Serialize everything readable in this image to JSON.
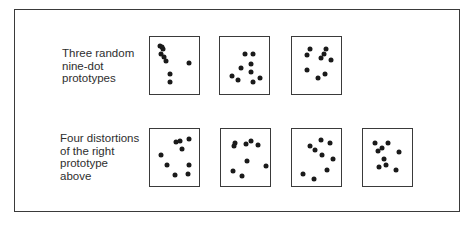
{
  "figure": {
    "top_label": [
      "Three random",
      "nine-dot",
      "prototypes"
    ],
    "bottom_label": [
      "Four distortions",
      "of the right",
      "prototype",
      "above"
    ]
  },
  "rows": [
    {
      "name": "prototypes",
      "boxes": [
        {
          "x": 149,
          "y": 36,
          "dots": [
            [
              10,
              9
            ],
            [
              13,
              12
            ],
            [
              11,
              17
            ],
            [
              14,
              20
            ],
            [
              16,
              24
            ],
            [
              20,
              37
            ],
            [
              20,
              45
            ],
            [
              39,
              26
            ],
            [
              12,
              10
            ]
          ]
        },
        {
          "x": 219,
          "y": 36,
          "dots": [
            [
              25,
              17
            ],
            [
              33,
              17
            ],
            [
              31,
              27
            ],
            [
              21,
              31
            ],
            [
              31,
              35
            ],
            [
              12,
              39
            ],
            [
              18,
              43
            ],
            [
              33,
              45
            ],
            [
              40,
              41
            ]
          ]
        },
        {
          "x": 291,
          "y": 36,
          "dots": [
            [
              18,
              12
            ],
            [
              34,
              12
            ],
            [
              15,
              18
            ],
            [
              32,
              17
            ],
            [
              29,
              21
            ],
            [
              39,
              23
            ],
            [
              15,
              33
            ],
            [
              26,
              41
            ],
            [
              33,
              37
            ]
          ]
        }
      ]
    },
    {
      "name": "distortions",
      "boxes": [
        {
          "x": 149,
          "y": 128,
          "dots": [
            [
              26,
              13
            ],
            [
              30,
              12
            ],
            [
              39,
              10
            ],
            [
              32,
              20
            ],
            [
              11,
              26
            ],
            [
              17,
              36
            ],
            [
              39,
              36
            ],
            [
              25,
              46
            ],
            [
              38,
              45
            ]
          ]
        },
        {
          "x": 220,
          "y": 128,
          "dots": [
            [
              14,
              14
            ],
            [
              13,
              17
            ],
            [
              25,
              15
            ],
            [
              30,
              12
            ],
            [
              37,
              16
            ],
            [
              26,
              32
            ],
            [
              45,
              37
            ],
            [
              12,
              42
            ],
            [
              21,
              47
            ]
          ]
        },
        {
          "x": 291,
          "y": 128,
          "dots": [
            [
              29,
              11
            ],
            [
              38,
              14
            ],
            [
              18,
              17
            ],
            [
              23,
              21
            ],
            [
              30,
              26
            ],
            [
              41,
              30
            ],
            [
              35,
              41
            ],
            [
              11,
              45
            ],
            [
              22,
              50
            ]
          ]
        },
        {
          "x": 362,
          "y": 128,
          "dots": [
            [
              12,
              14
            ],
            [
              25,
              14
            ],
            [
              15,
              22
            ],
            [
              19,
              19
            ],
            [
              21,
              30
            ],
            [
              36,
              23
            ],
            [
              16,
              38
            ],
            [
              23,
              36
            ],
            [
              33,
              41
            ]
          ]
        }
      ]
    }
  ],
  "colors": {
    "ink": "#1a1a1a",
    "frame": "#3a3a3a",
    "background": "#ffffff"
  }
}
